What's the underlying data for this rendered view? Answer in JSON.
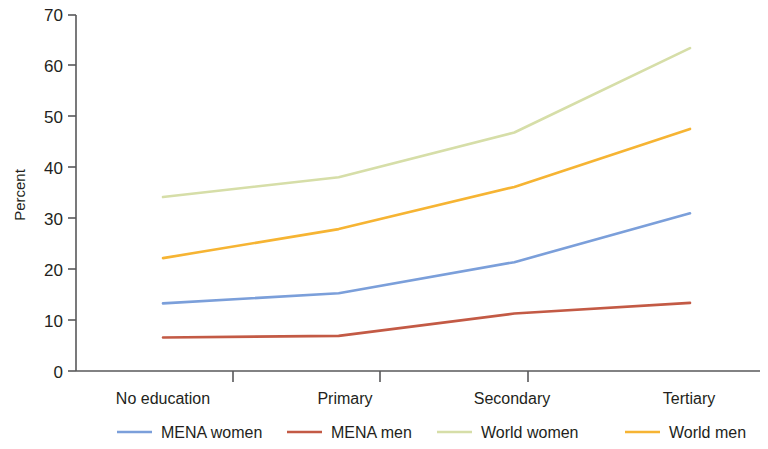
{
  "chart_data": {
    "type": "line",
    "title": "",
    "xlabel": "",
    "ylabel": "Percent",
    "categories": [
      "No education",
      "Primary",
      "Secondary",
      "Tertiary"
    ],
    "ylim": [
      0,
      70
    ],
    "yticks": [
      0,
      10,
      20,
      30,
      40,
      50,
      60,
      70
    ],
    "grid": false,
    "legend_position": "bottom",
    "series": [
      {
        "name": "MENA women",
        "color": "#7B9FDA",
        "values": [
          13.3,
          15.3,
          21.4,
          31.0
        ]
      },
      {
        "name": "MENA men",
        "color": "#C35A45",
        "values": [
          6.6,
          6.9,
          11.3,
          13.4
        ]
      },
      {
        "name": "World women",
        "color": "#D6DEA8",
        "values": [
          34.2,
          38.1,
          46.9,
          63.5
        ]
      },
      {
        "name": "World men",
        "color": "#F6B433",
        "values": [
          22.2,
          27.9,
          36.2,
          47.6
        ]
      }
    ]
  },
  "axis": {
    "y_tick_labels": [
      "0",
      "10",
      "20",
      "30",
      "40",
      "50",
      "60",
      "70"
    ],
    "y_axis_title": "Percent",
    "x_tick_labels": [
      "No education",
      "Primary",
      "Secondary",
      "Tertiary"
    ]
  },
  "legend": {
    "entries": [
      {
        "label": "MENA women",
        "color": "#7B9FDA"
      },
      {
        "label": "MENA men",
        "color": "#C35A45"
      },
      {
        "label": "World women",
        "color": "#D6DEA8"
      },
      {
        "label": "World men",
        "color": "#F6B433"
      }
    ]
  }
}
